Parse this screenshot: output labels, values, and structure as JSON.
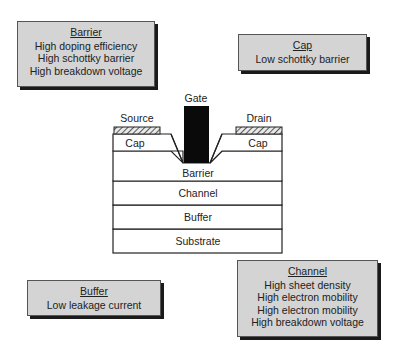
{
  "callouts": {
    "barrier": {
      "title": "Barrier",
      "lines": [
        "High doping efficiency",
        "High schottky barrier",
        "High breakdown voltage"
      ]
    },
    "cap": {
      "title": "Cap",
      "lines": [
        "Low schottky barrier"
      ]
    },
    "buffer": {
      "title": "Buffer",
      "lines": [
        "Low leakage current"
      ]
    },
    "channel": {
      "title": "Channel",
      "lines": [
        "High sheet density",
        "High electron mobility",
        "High electron mobility",
        "High breakdown voltage"
      ]
    }
  },
  "device": {
    "gate_label": "Gate",
    "source_label": "Source",
    "drain_label": "Drain",
    "cap_left_label": "Cap",
    "cap_right_label": "Cap",
    "layers": [
      "Barrier",
      "Channel",
      "Buffer",
      "Substrate"
    ]
  }
}
